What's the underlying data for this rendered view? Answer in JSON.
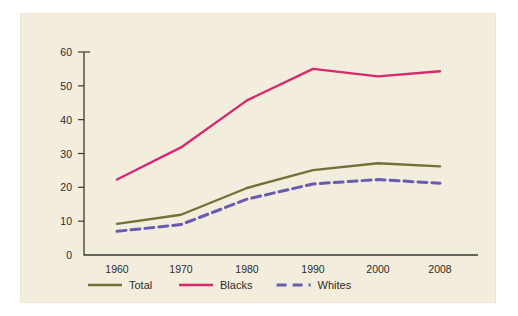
{
  "figure": {
    "background_color": "#ffffff",
    "panel_color": "#f3eede"
  },
  "chart_data": {
    "type": "line",
    "title": "",
    "subtitle": "",
    "xlabel": "",
    "ylabel": "",
    "categories": [
      "1960",
      "1970",
      "1980",
      "1990",
      "2000",
      "2008"
    ],
    "x_tick_labels": [
      "1960",
      "1970",
      "1980",
      "1990",
      "2000",
      "2008"
    ],
    "y_tick_labels": [
      "0",
      "10",
      "20",
      "30",
      "40",
      "50",
      "60"
    ],
    "y_ticks": [
      0,
      10,
      20,
      30,
      40,
      50,
      60
    ],
    "ylim": [
      0,
      60
    ],
    "grid": false,
    "legend_position": "bottom-left",
    "series": [
      {
        "name": "Total",
        "color": "#6f7338",
        "style": "solid",
        "values": [
          9.2,
          11.9,
          19.8,
          25.1,
          27.1,
          26.2
        ]
      },
      {
        "name": "Blacks",
        "color": "#d62a6e",
        "style": "solid",
        "values": [
          22.3,
          31.8,
          45.7,
          55.0,
          52.8,
          54.3
        ]
      },
      {
        "name": "Whites",
        "color": "#6b5bb0",
        "style": "dashed",
        "values": [
          7.0,
          9.0,
          16.5,
          21.0,
          22.3,
          21.2
        ]
      }
    ],
    "annotations": []
  },
  "legend": {
    "items": [
      {
        "label": "Total",
        "color": "#6f7338",
        "style": "solid"
      },
      {
        "label": "Blacks",
        "color": "#d62a6e",
        "style": "solid"
      },
      {
        "label": "Whites",
        "color": "#6b5bb0",
        "style": "dashed"
      }
    ]
  }
}
